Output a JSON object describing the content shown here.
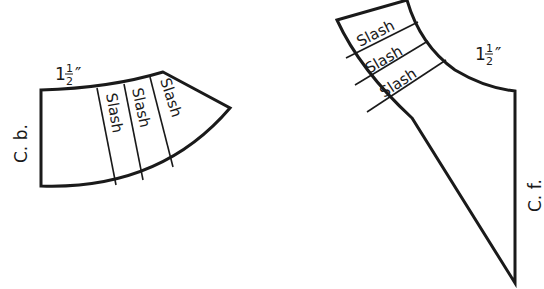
{
  "diagram": {
    "type": "sewing-pattern-pieces",
    "stroke_color": "#1a1a1a",
    "background": "#ffffff",
    "pieces": [
      {
        "id": "back-piece",
        "edge_label": "C. b.",
        "measurement": {
          "whole": "1",
          "num": "1",
          "den": "2",
          "unit": "″"
        },
        "slash_labels": [
          "Slash",
          "Slash",
          "Slash"
        ]
      },
      {
        "id": "front-piece",
        "edge_label": "C. f.",
        "measurement": {
          "whole": "1",
          "num": "1",
          "den": "2",
          "unit": "″"
        },
        "slash_labels": [
          "Slash",
          "Slash",
          "Slash"
        ]
      }
    ]
  }
}
